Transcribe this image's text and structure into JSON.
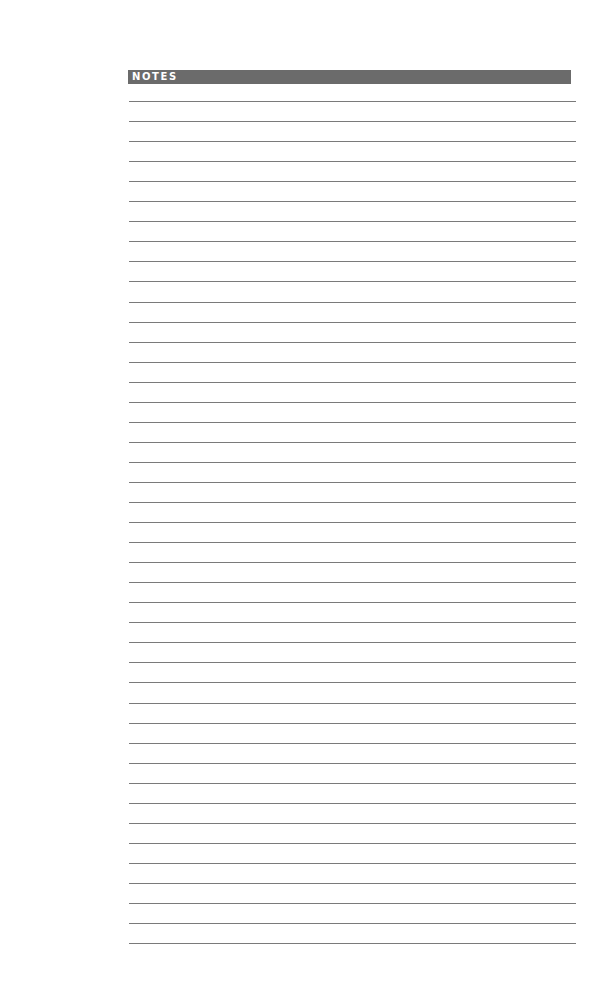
{
  "page": {
    "type": "notes-page",
    "header": {
      "title": "NOTES",
      "background_color": "#6b6b6b",
      "text_color": "#ffffff"
    },
    "ruled_lines": {
      "count": 43,
      "first_y": 101,
      "pitch": 20.05,
      "color": "#7a7a7a"
    }
  }
}
